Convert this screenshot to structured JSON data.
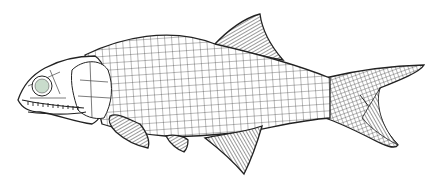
{
  "figure": {
    "subject": "Fossil fish reconstruction line drawing",
    "background_color": "#ffffff",
    "line_color": "#2a2a2a",
    "eye_color": "#c9dccc",
    "parts": [
      "head",
      "eye",
      "jaw-teeth",
      "body-scales",
      "dorsal-fin",
      "pectoral-fin",
      "pelvic-fin",
      "anal-fin",
      "caudal-fin"
    ]
  }
}
